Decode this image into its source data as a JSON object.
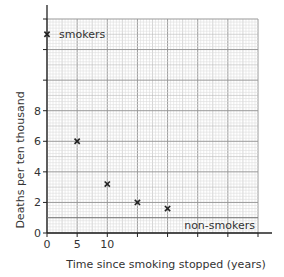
{
  "chart_data": {
    "type": "scatter",
    "title": "",
    "xlabel": "Time since smoking stopped (years)",
    "ylabel": "Deaths  per ten thousand",
    "xlim": [
      0,
      35
    ],
    "ylim": [
      0,
      14
    ],
    "grid": true,
    "x_tick_labels": [
      "0",
      "5",
      "10"
    ],
    "x_ticks": [
      0,
      5,
      10,
      15,
      20,
      25,
      30,
      35
    ],
    "y_tick_labels": [
      "0",
      "2",
      "4",
      "6",
      "8"
    ],
    "y_ticks": [
      0,
      2,
      4,
      6,
      8,
      10,
      12,
      14
    ],
    "series": [
      {
        "name": "smokers",
        "points": [
          {
            "x": 0,
            "y": 13
          }
        ]
      },
      {
        "name": "ex-smokers",
        "points": [
          {
            "x": 5,
            "y": 6
          },
          {
            "x": 10,
            "y": 3.2
          },
          {
            "x": 15,
            "y": 2
          },
          {
            "x": 20,
            "y": 1.6
          }
        ]
      }
    ],
    "reference_lines": [
      {
        "label": "non-smokers",
        "y": 1
      }
    ],
    "annotations": [
      {
        "text": "smokers",
        "x": 0,
        "y": 13
      },
      {
        "text": "non-smokers",
        "x": 35,
        "y": 1
      }
    ],
    "marker": "x"
  }
}
